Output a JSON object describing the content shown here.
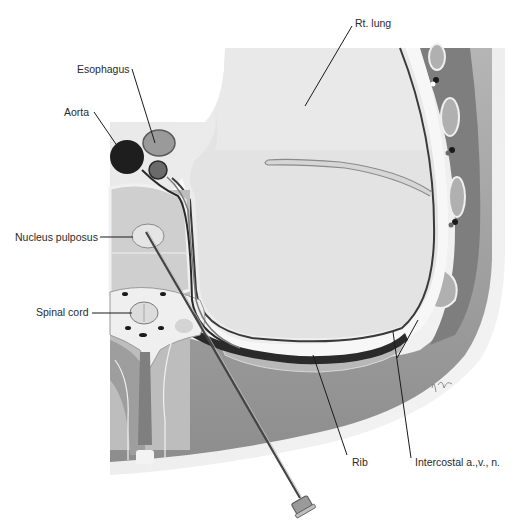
{
  "figure": {
    "type": "anatomical cross-section",
    "labels": {
      "esophagus": "Esophagus",
      "aorta": "Aorta",
      "rt_lung": "Rt. lung",
      "nucleus_pulposus": "Nucleus pulposus",
      "spinal_cord": "Spinal cord",
      "rib": "Rib",
      "intercostal": "Intercostal a.,v., n."
    },
    "colors": {
      "background": "#ffffff",
      "lung": "#e4e4e4",
      "chest_wall": "#8e8e8e",
      "muscle": "#a8a8a8",
      "body_edge": "#d9d9d9",
      "aorta": "#1e1e1e",
      "esophagus": "#9a9a9a",
      "pleura_line": "#3a3a3a",
      "needle": "#555555"
    }
  }
}
